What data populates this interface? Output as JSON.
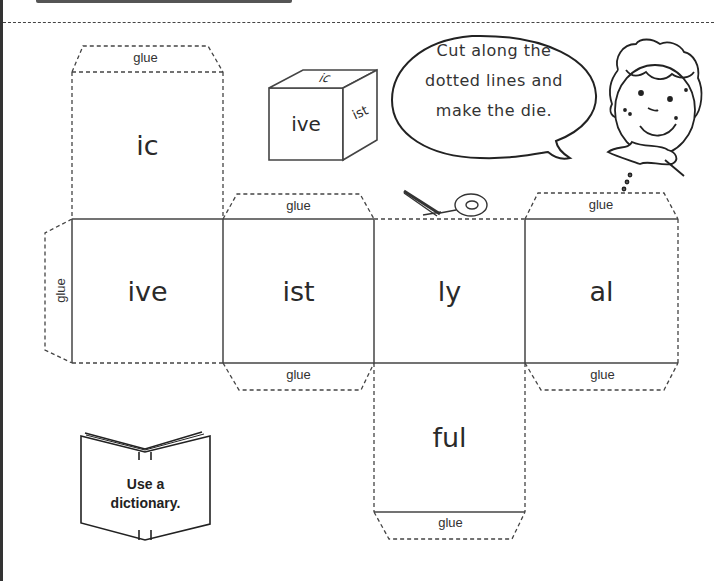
{
  "worksheet": {
    "instruction": {
      "lines": [
        "Cut along the",
        "dotted lines and",
        "make the die."
      ]
    },
    "die_faces": [
      {
        "id": "top",
        "label": "ic"
      },
      {
        "id": "left",
        "label": "ive"
      },
      {
        "id": "front",
        "label": "ist"
      },
      {
        "id": "right",
        "label": "ly"
      },
      {
        "id": "back",
        "label": "al"
      },
      {
        "id": "bottom",
        "label": "ful"
      }
    ],
    "glue_tabs": [
      {
        "id": "glue-top-ic",
        "label": "glue"
      },
      {
        "id": "glue-left",
        "label": "glue"
      },
      {
        "id": "glue-ist-top",
        "label": "glue"
      },
      {
        "id": "glue-ist-bottom",
        "label": "glue"
      },
      {
        "id": "glue-al-top",
        "label": "glue"
      },
      {
        "id": "glue-al-bottom",
        "label": "glue"
      },
      {
        "id": "glue-ful-bottom",
        "label": "glue"
      }
    ],
    "example_cube": {
      "front": "ive",
      "top": "ic",
      "side": "ist"
    },
    "book_tip": {
      "lines": [
        "Use a",
        "dictionary."
      ]
    },
    "icons": [
      "scissors-icon",
      "boy-character-icon",
      "speech-bubble-icon",
      "open-book-icon",
      "cube-icon"
    ]
  }
}
